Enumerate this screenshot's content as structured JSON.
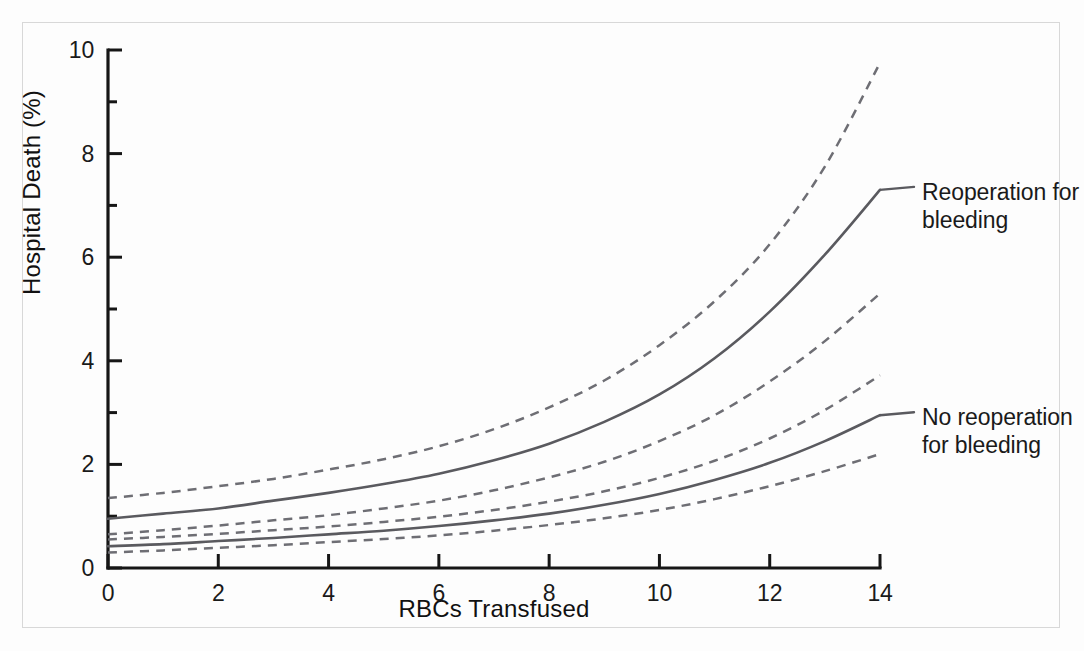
{
  "figure": {
    "background_color": "#fdfdfd",
    "border_color": "#d8d8d8",
    "axis_color": "#161616",
    "curve_color": "#5a5a5f"
  },
  "axes": {
    "y_title": "Hospital Death (%)",
    "x_title": "RBCs Transfused",
    "y_ticks": [
      "0",
      "2",
      "4",
      "6",
      "8",
      "10"
    ],
    "x_ticks": [
      "0",
      "2",
      "4",
      "6",
      "8",
      "10",
      "12",
      "14"
    ]
  },
  "annotations": {
    "upper": "Reoperation for\nbleeding",
    "lower": "No reoperation\nfor bleeding"
  },
  "chart_data": {
    "type": "line",
    "title": "",
    "xlabel": "RBCs Transfused",
    "ylabel": "Hospital Death (%)",
    "xlim": [
      0,
      14
    ],
    "ylim": [
      0,
      10
    ],
    "x_ticks": [
      0,
      2,
      4,
      6,
      8,
      10,
      12,
      14
    ],
    "y_ticks": [
      0,
      2,
      4,
      6,
      8,
      10
    ],
    "y_minor_ticks": [
      1,
      3,
      5,
      7,
      9
    ],
    "grid": false,
    "legend": "inline-annotations-right",
    "x": [
      0,
      1,
      2,
      3,
      4,
      5,
      6,
      7,
      8,
      9,
      10,
      11,
      12,
      13,
      14
    ],
    "series": [
      {
        "name": "Reoperation for bleeding — upper 95% CL",
        "style": "dashed",
        "values": [
          1.35,
          1.45,
          1.58,
          1.72,
          1.9,
          2.1,
          2.35,
          2.68,
          3.1,
          3.62,
          4.3,
          5.15,
          6.25,
          7.75,
          9.75
        ]
      },
      {
        "name": "Reoperation for bleeding",
        "style": "solid",
        "values": [
          0.95,
          1.05,
          1.15,
          1.3,
          1.45,
          1.62,
          1.82,
          2.08,
          2.4,
          2.82,
          3.35,
          4.05,
          4.95,
          6.05,
          7.3
        ]
      },
      {
        "name": "Reoperation for bleeding — lower 95% CL",
        "style": "dashed",
        "values": [
          0.65,
          0.73,
          0.82,
          0.92,
          1.02,
          1.15,
          1.3,
          1.5,
          1.75,
          2.05,
          2.45,
          2.95,
          3.6,
          4.38,
          5.3
        ]
      },
      {
        "name": "No reoperation for bleeding — upper 95% CL",
        "style": "dashed",
        "values": [
          0.55,
          0.6,
          0.66,
          0.73,
          0.8,
          0.89,
          0.99,
          1.12,
          1.28,
          1.48,
          1.74,
          2.07,
          2.5,
          3.05,
          3.72
        ]
      },
      {
        "name": "No reoperation for bleeding",
        "style": "solid",
        "values": [
          0.42,
          0.46,
          0.52,
          0.58,
          0.65,
          0.72,
          0.81,
          0.92,
          1.05,
          1.22,
          1.43,
          1.7,
          2.03,
          2.45,
          2.95
        ]
      },
      {
        "name": "No reoperation for bleeding — lower 95% CL",
        "style": "dashed",
        "values": [
          0.3,
          0.34,
          0.39,
          0.44,
          0.5,
          0.56,
          0.63,
          0.72,
          0.83,
          0.96,
          1.12,
          1.33,
          1.58,
          1.87,
          2.2
        ]
      }
    ]
  }
}
